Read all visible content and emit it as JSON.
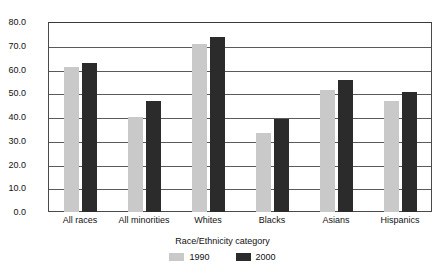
{
  "chart_data": {
    "type": "bar",
    "title": "",
    "xlabel": "Race/Ethnicity category",
    "ylabel": "Percent residing in suburbs",
    "ylim": [
      0.0,
      80.0
    ],
    "ytick_step": 10.0,
    "grid": true,
    "legend_position": "bottom",
    "categories": [
      "All races",
      "All minorities",
      "Whites",
      "Blacks",
      "Asians",
      "Hispanics"
    ],
    "ytick_labels": [
      "80.0",
      "70.0",
      "60.0",
      "50.0",
      "40.0",
      "30.0",
      "20.0",
      "10.0",
      "0.0"
    ],
    "ytick_values": [
      80.0,
      70.0,
      60.0,
      50.0,
      40.0,
      30.0,
      20.0,
      10.0,
      0.0
    ],
    "series": [
      {
        "name": "1990",
        "color": "#c9c9c9",
        "values": [
          61.0,
          40.0,
          70.7,
          33.3,
          51.4,
          46.7
        ]
      },
      {
        "name": "2000",
        "color": "#2b2b2b",
        "values": [
          62.7,
          46.7,
          73.7,
          39.2,
          55.6,
          50.5
        ]
      }
    ]
  }
}
